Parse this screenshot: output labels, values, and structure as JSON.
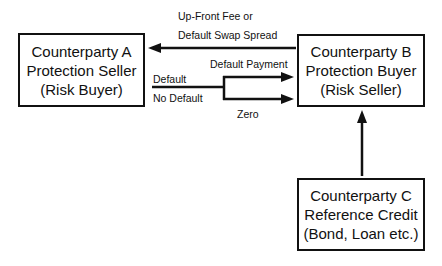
{
  "diagram": {
    "type": "credit-default-swap-flow",
    "nodes": {
      "a": {
        "lines": [
          "Counterparty A",
          "Protection Seller",
          "(Risk Buyer)"
        ]
      },
      "b": {
        "lines": [
          "Counterparty B",
          "Protection Buyer",
          "(Risk Seller)"
        ]
      },
      "c": {
        "lines": [
          "Counterparty C",
          "Reference Credit",
          "(Bond, Loan etc.)"
        ]
      }
    },
    "edges": {
      "fee": {
        "from": "b",
        "to": "a",
        "label_lines": [
          "Up-Front Fee or",
          "Default Swap Spread"
        ]
      },
      "default_payment": {
        "from": "a",
        "to": "b",
        "condition": "Default",
        "label": "Default Payment"
      },
      "zero": {
        "from": "a",
        "to": "b",
        "condition": "No Default",
        "label": "Zero"
      },
      "reference": {
        "from": "c",
        "to": "b"
      }
    },
    "colors": {
      "stroke": "#111111",
      "background": "#ffffff"
    }
  }
}
